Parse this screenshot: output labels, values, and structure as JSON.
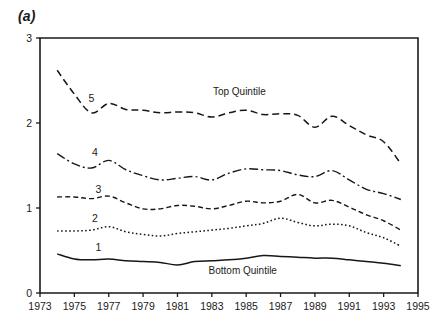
{
  "figure": {
    "panel_label": "(a)",
    "background": "#ffffff",
    "line_color": "#17171a"
  },
  "chart_data": {
    "type": "line",
    "title": "",
    "subtitle": "",
    "xlabel": "",
    "ylabel": "",
    "xlim": [
      1973,
      1995
    ],
    "ylim": [
      0,
      3
    ],
    "grid": false,
    "legend_position": "inline-annotations",
    "x_tick_labels": [
      "1973",
      "1975",
      "1977",
      "1979",
      "1981",
      "1983",
      "1985",
      "1987",
      "1989",
      "1991",
      "1993",
      "1995"
    ],
    "x_tick_values": [
      1973,
      1975,
      1977,
      1979,
      1981,
      1983,
      1985,
      1987,
      1989,
      1991,
      1993,
      1995
    ],
    "y_tick_labels": [
      "0",
      "1",
      "2",
      "3"
    ],
    "y_tick_values": [
      0,
      1,
      2,
      3
    ],
    "x": [
      1974,
      1975,
      1976,
      1977,
      1978,
      1979,
      1980,
      1981,
      1982,
      1983,
      1984,
      1985,
      1986,
      1987,
      1988,
      1989,
      1990,
      1991,
      1992,
      1993,
      1994
    ],
    "series": [
      {
        "name": "5",
        "label": "5",
        "annotation": "Top Quintile",
        "style": "dashed",
        "dasharray": "7,4",
        "width": 1.5,
        "label_x": 1976.0,
        "label_y": 2.25,
        "annotation_x": 1984.6,
        "annotation_y": 2.33,
        "values": [
          2.62,
          2.34,
          2.12,
          2.23,
          2.16,
          2.15,
          2.12,
          2.13,
          2.12,
          2.07,
          2.12,
          2.15,
          2.1,
          2.11,
          2.09,
          1.95,
          2.08,
          1.97,
          1.86,
          1.78,
          1.52
        ]
      },
      {
        "name": "4",
        "label": "4",
        "annotation": "",
        "style": "dash-dot",
        "dasharray": "9,3,2,3",
        "width": 1.4,
        "label_x": 1976.2,
        "label_y": 1.61,
        "annotation_x": null,
        "annotation_y": null,
        "values": [
          1.64,
          1.52,
          1.47,
          1.56,
          1.45,
          1.38,
          1.33,
          1.35,
          1.37,
          1.33,
          1.41,
          1.46,
          1.45,
          1.44,
          1.39,
          1.37,
          1.44,
          1.33,
          1.22,
          1.17,
          1.1
        ]
      },
      {
        "name": "3",
        "label": "3",
        "annotation": "",
        "style": "short-dash",
        "dasharray": "5,3",
        "width": 1.4,
        "label_x": 1976.4,
        "label_y": 1.18,
        "annotation_x": null,
        "annotation_y": null,
        "values": [
          1.13,
          1.13,
          1.11,
          1.14,
          1.06,
          0.99,
          0.99,
          1.03,
          1.02,
          0.99,
          1.03,
          1.08,
          1.06,
          1.08,
          1.16,
          1.06,
          1.09,
          1.01,
          0.92,
          0.85,
          0.74
        ]
      },
      {
        "name": "2",
        "label": "2",
        "annotation": "",
        "style": "dotted",
        "dasharray": "1.6,2.4",
        "width": 1.5,
        "label_x": 1976.2,
        "label_y": 0.83,
        "annotation_x": null,
        "annotation_y": null,
        "values": [
          0.73,
          0.73,
          0.74,
          0.78,
          0.72,
          0.69,
          0.67,
          0.7,
          0.72,
          0.74,
          0.76,
          0.79,
          0.82,
          0.88,
          0.83,
          0.79,
          0.81,
          0.79,
          0.71,
          0.65,
          0.55
        ]
      },
      {
        "name": "1",
        "label": "1",
        "annotation": "Bottom Quintile",
        "style": "solid",
        "dasharray": "",
        "width": 1.5,
        "label_x": 1976.4,
        "label_y": 0.49,
        "annotation_x": 1984.8,
        "annotation_y": 0.22,
        "values": [
          0.46,
          0.4,
          0.39,
          0.4,
          0.38,
          0.37,
          0.36,
          0.33,
          0.37,
          0.38,
          0.39,
          0.41,
          0.44,
          0.43,
          0.42,
          0.41,
          0.41,
          0.39,
          0.37,
          0.35,
          0.32
        ]
      }
    ]
  }
}
